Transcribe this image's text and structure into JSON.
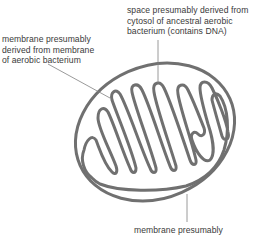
{
  "diagram": {
    "labels": {
      "matrix_space": "space presumably derived from\ncytosol of ancestral aerobic\nbacterium (contains DNA)",
      "inner_membrane": "membrane presumably\nderived from membrane\nof aerobic bacterium",
      "outer_membrane": "membrane presumably"
    },
    "colors": {
      "stroke": "#707070",
      "leader": "#808080",
      "text": "#3a3a3a",
      "background": "#ffffff"
    }
  }
}
